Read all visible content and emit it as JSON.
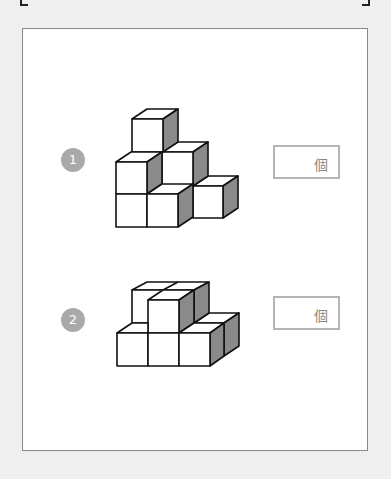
{
  "problems": [
    {
      "number": "1",
      "unit": "個",
      "answer": ""
    },
    {
      "number": "2",
      "unit": "個",
      "answer": ""
    }
  ],
  "colors": {
    "badge": "#a9a9a9",
    "cube_side_shade": "#8a8a8a",
    "cube_face": "#ffffff",
    "box_border": "#b5b5b5"
  }
}
